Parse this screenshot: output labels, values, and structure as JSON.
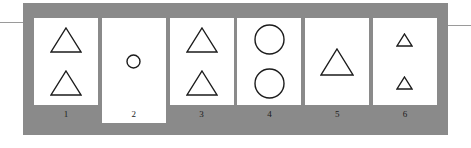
{
  "figure": {
    "panel_color": "#8a8a8a",
    "card_color": "#ffffff",
    "stroke_color": "#1b1b1b",
    "rule_color": "#9a9a9a",
    "cards": [
      {
        "number": "1",
        "shapes": [
          {
            "kind": "triangle",
            "size": 32,
            "count_index": 0
          },
          {
            "kind": "triangle",
            "size": 32,
            "count_index": 1
          }
        ]
      },
      {
        "number": "2",
        "shapes": [
          {
            "kind": "circle",
            "size": 15,
            "count_index": 0
          }
        ]
      },
      {
        "number": "3",
        "shapes": [
          {
            "kind": "triangle",
            "size": 32,
            "count_index": 0
          },
          {
            "kind": "triangle",
            "size": 32,
            "count_index": 1
          }
        ]
      },
      {
        "number": "4",
        "shapes": [
          {
            "kind": "circle",
            "size": 31,
            "count_index": 0
          },
          {
            "kind": "circle",
            "size": 31,
            "count_index": 1
          }
        ]
      },
      {
        "number": "5",
        "shapes": [
          {
            "kind": "triangle",
            "size": 34,
            "count_index": 0
          }
        ]
      },
      {
        "number": "6",
        "shapes": [
          {
            "kind": "triangle",
            "size": 17,
            "count_index": 0
          },
          {
            "kind": "triangle",
            "size": 17,
            "count_index": 1
          }
        ]
      }
    ]
  }
}
